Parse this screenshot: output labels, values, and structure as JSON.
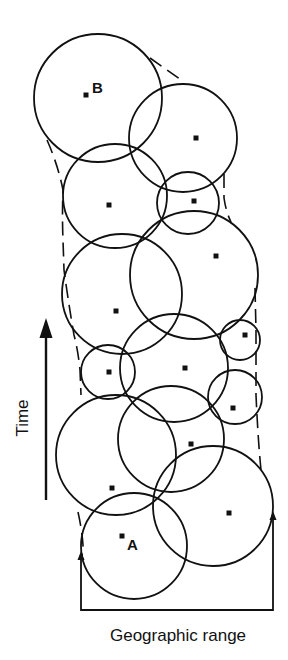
{
  "figure": {
    "type": "diagram",
    "colors": {
      "stroke": "#111111",
      "background": "#ffffff"
    },
    "axes": {
      "y_label": "Time",
      "x_label": "Geographic range",
      "y_arrow": {
        "x": 46,
        "y_tail": 500,
        "y_head": 318
      }
    },
    "points": [
      {
        "label": "B",
        "dot": [
          86,
          95
        ],
        "label_pos": [
          92,
          93
        ]
      },
      {
        "label": "A",
        "dot": [
          122,
          536
        ],
        "label_pos": [
          127,
          550
        ]
      }
    ],
    "circles": [
      {
        "cx": 98,
        "cy": 98,
        "r": 64,
        "dot": [
          86,
          95
        ]
      },
      {
        "cx": 183,
        "cy": 138,
        "r": 54,
        "dot": [
          196,
          138
        ]
      },
      {
        "cx": 115,
        "cy": 196,
        "r": 52,
        "dot": [
          109,
          205
        ]
      },
      {
        "cx": 188,
        "cy": 203,
        "r": 31,
        "dot": [
          194,
          201
        ]
      },
      {
        "cx": 122,
        "cy": 294,
        "r": 60,
        "dot": [
          116,
          311
        ]
      },
      {
        "cx": 194,
        "cy": 275,
        "r": 64,
        "dot": [
          216,
          256
        ]
      },
      {
        "cx": 108,
        "cy": 372,
        "r": 27,
        "dot": [
          109,
          372
        ]
      },
      {
        "cx": 174,
        "cy": 368,
        "r": 54,
        "dot": [
          185,
          368
        ]
      },
      {
        "cx": 240,
        "cy": 340,
        "r": 20,
        "dot": [
          245,
          335
        ]
      },
      {
        "cx": 235,
        "cy": 397,
        "r": 27,
        "dot": [
          233,
          408
        ]
      },
      {
        "cx": 116,
        "cy": 455,
        "r": 60,
        "dot": [
          112,
          488
        ]
      },
      {
        "cx": 171,
        "cy": 439,
        "r": 53,
        "dot": [
          191,
          444
        ]
      },
      {
        "cx": 134,
        "cy": 546,
        "r": 53,
        "dot": [
          122,
          536
        ]
      },
      {
        "cx": 213,
        "cy": 506,
        "r": 60,
        "dot": [
          229,
          513
        ]
      }
    ],
    "range_box": {
      "left_x": 81,
      "right_x": 273,
      "bottom_y": 610,
      "left_top_y": 558,
      "right_top_y": 518
    }
  }
}
